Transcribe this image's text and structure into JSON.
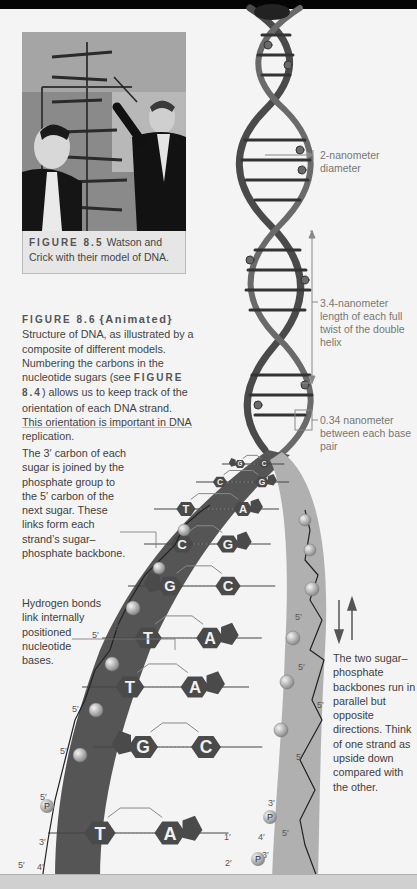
{
  "figure_8_5": {
    "label": "FIGURE 8.5",
    "caption": "Watson and Crick with their model of DNA.",
    "image_alt": "Photograph of Watson and Crick with their DNA model"
  },
  "figure_8_6": {
    "label": "FIGURE 8.6",
    "tag": "{Animated}",
    "caption_part1": "Structure of DNA, as illustrated by a composite of different models. Numbering the carbons in the nucleotide sugars (see ",
    "ref": "FIGURE 8.4",
    "caption_part2": ") allows us to keep track of the orientation of each DNA strand. This orientation is important in DNA replication."
  },
  "annotations": {
    "backbone_note": "The 3′ carbon of each sugar is joined by the phosphate group to the 5′ carbon of the next sugar. These links form each strand’s sugar–phosphate backbone.",
    "hydrogen_note": "Hydrogen bonds link internally positioned nucleotide bases.",
    "antiparallel_note": "The two sugar–phosphate backbones run in parallel but opposite directions. Think of one strand as upside down compared with the other."
  },
  "measurements": {
    "diameter": "2-nanometer diameter",
    "twist": "3.4-nanometer length of each full twist of the double helix",
    "base_pair": "0.34 nanometer between each base pair"
  },
  "base_pairs": [
    {
      "left": "G",
      "right": "C"
    },
    {
      "left": "C",
      "right": "G"
    },
    {
      "left": "T",
      "right": "A"
    },
    {
      "left": "C",
      "right": "G"
    },
    {
      "left": "G",
      "right": "C"
    },
    {
      "left": "T",
      "right": "A"
    },
    {
      "left": "T",
      "right": "A"
    },
    {
      "left": "G",
      "right": "C"
    },
    {
      "left": "T",
      "right": "A"
    }
  ],
  "carbon_labels": {
    "three_prime": "3′",
    "five_prime": "5′",
    "one_prime": "1′",
    "two_prime": "2′",
    "four_prime": "4′",
    "phosphate": "P"
  }
}
